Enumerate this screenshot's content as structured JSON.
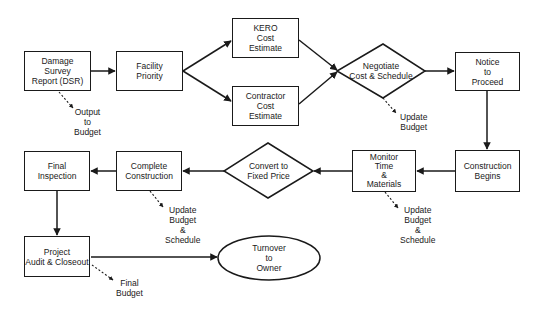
{
  "diagram": {
    "type": "flowchart",
    "nodes": {
      "dsr": {
        "label": "Damage\nSurvey\nReport (DSR)",
        "shape": "rectangle"
      },
      "facility_priority": {
        "label": "Facility\nPriority",
        "shape": "rectangle"
      },
      "kero_estimate": {
        "label": "KERO\nCost\nEstimate",
        "shape": "rectangle"
      },
      "contractor_estimate": {
        "label": "Contractor\nCost\nEstimate",
        "shape": "rectangle"
      },
      "negotiate": {
        "label": "Negotiate\nCost & Schedule",
        "shape": "diamond"
      },
      "notice_to_proceed": {
        "label": "Notice\nto\nProceed",
        "shape": "rectangle"
      },
      "construction_begins": {
        "label": "Construction\nBegins",
        "shape": "rectangle"
      },
      "monitor": {
        "label": "Monitor\nTime\n&\nMaterials",
        "shape": "rectangle"
      },
      "convert_fixed_price": {
        "label": "Convert to\nFixed Price",
        "shape": "diamond"
      },
      "complete_construction": {
        "label": "Complete\nConstruction",
        "shape": "rectangle"
      },
      "final_inspection": {
        "label": "Final\nInspection",
        "shape": "rectangle"
      },
      "audit_closeout": {
        "label": "Project\nAudit & Closeout",
        "shape": "rectangle"
      },
      "turnover": {
        "label": "Turnover\nto\nOwner",
        "shape": "ellipse"
      }
    },
    "outputs": {
      "dsr_output": "Output\nto\nBudget",
      "negotiate_output": "Update\nBudget",
      "monitor_output": "Update\nBudget\n&\nSchedule",
      "complete_output": "Update\nBudget\n&\nSchedule",
      "audit_output": "Final\nBudget"
    },
    "edges": [
      {
        "from": "dsr",
        "to": "facility_priority",
        "style": "solid"
      },
      {
        "from": "facility_priority",
        "to": "kero_estimate",
        "style": "solid"
      },
      {
        "from": "facility_priority",
        "to": "contractor_estimate",
        "style": "solid"
      },
      {
        "from": "kero_estimate",
        "to": "negotiate",
        "style": "solid"
      },
      {
        "from": "contractor_estimate",
        "to": "negotiate",
        "style": "solid"
      },
      {
        "from": "negotiate",
        "to": "notice_to_proceed",
        "style": "solid"
      },
      {
        "from": "notice_to_proceed",
        "to": "construction_begins",
        "style": "solid"
      },
      {
        "from": "construction_begins",
        "to": "monitor",
        "style": "solid"
      },
      {
        "from": "monitor",
        "to": "convert_fixed_price",
        "style": "solid"
      },
      {
        "from": "convert_fixed_price",
        "to": "complete_construction",
        "style": "solid"
      },
      {
        "from": "complete_construction",
        "to": "final_inspection",
        "style": "solid"
      },
      {
        "from": "final_inspection",
        "to": "audit_closeout",
        "style": "solid"
      },
      {
        "from": "audit_closeout",
        "to": "turnover",
        "style": "solid"
      },
      {
        "from": "dsr",
        "to": "dsr_output",
        "style": "dashed"
      },
      {
        "from": "negotiate",
        "to": "negotiate_output",
        "style": "dashed"
      },
      {
        "from": "monitor",
        "to": "monitor_output",
        "style": "dashed"
      },
      {
        "from": "complete_construction",
        "to": "complete_output",
        "style": "dashed"
      },
      {
        "from": "audit_closeout",
        "to": "audit_output",
        "style": "dashed"
      }
    ],
    "colors": {
      "stroke": "#1a1a1a",
      "fill": "#ffffff"
    }
  }
}
